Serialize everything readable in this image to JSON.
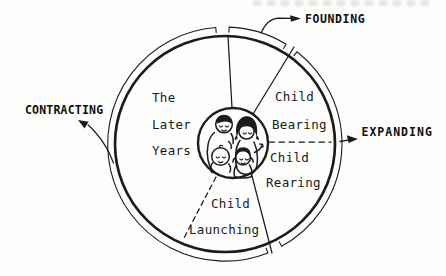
{
  "page": {
    "background": "#fdfdfb",
    "ink": "#1c1c1c"
  },
  "diagram": {
    "phases": {
      "founding": "FOUNDING",
      "expanding": "EXPANDING",
      "contracting": "CONTRACTING"
    },
    "sectors": {
      "later_years": {
        "lines": [
          "The",
          "Later",
          "Years"
        ]
      },
      "child_bearing": {
        "lines": [
          "Child",
          "Bearing"
        ]
      },
      "child_rearing": {
        "lines": [
          "Child",
          "Rearing"
        ]
      },
      "child_launching": {
        "lines": [
          "Child",
          "Launching"
        ]
      }
    },
    "center": {
      "icon": "family-icon"
    }
  }
}
